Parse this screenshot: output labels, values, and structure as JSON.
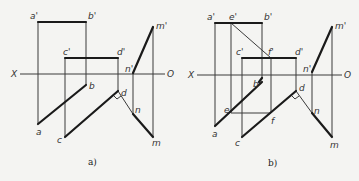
{
  "panels": [
    {
      "id": "a",
      "caption": "a)",
      "axis": {
        "left_label": "X",
        "right_label": "O"
      },
      "labels": {
        "a_prime": "a'",
        "b_prime": "b'",
        "c_prime": "c'",
        "d_prime": "d'",
        "m_prime": "m'",
        "n_prime": "n'",
        "a": "a",
        "b": "b",
        "c": "c",
        "d": "d",
        "m": "m",
        "n": "n"
      }
    },
    {
      "id": "b",
      "caption": "b)",
      "axis": {
        "left_label": "X",
        "right_label": "O"
      },
      "labels": {
        "a_prime": "a'",
        "e_prime": "e'",
        "b_prime": "b'",
        "c_prime": "c'",
        "f_prime": "f'",
        "d_prime": "d'",
        "m_prime": "m'",
        "n_prime": "n'",
        "a": "a",
        "b": "b",
        "c": "c",
        "d": "d",
        "e": "e",
        "f": "f",
        "m": "m",
        "n": "n"
      }
    }
  ]
}
